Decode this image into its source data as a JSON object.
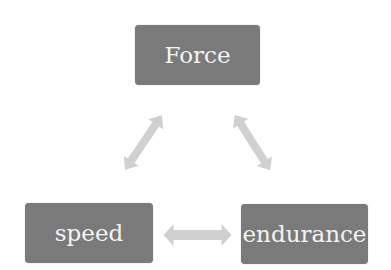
{
  "diagram": {
    "type": "cycle",
    "nodes": [
      {
        "id": "force",
        "label": "Force"
      },
      {
        "id": "speed",
        "label": "speed"
      },
      {
        "id": "endurance",
        "label": "endurance"
      }
    ],
    "edges": [
      {
        "from": "force",
        "to": "speed",
        "bidirectional": true
      },
      {
        "from": "force",
        "to": "endurance",
        "bidirectional": true
      },
      {
        "from": "speed",
        "to": "endurance",
        "bidirectional": true
      }
    ],
    "colors": {
      "node_fill": "#7a7a7a",
      "node_text": "#f4f4f4",
      "arrow_fill": "#d0d0d0"
    }
  }
}
